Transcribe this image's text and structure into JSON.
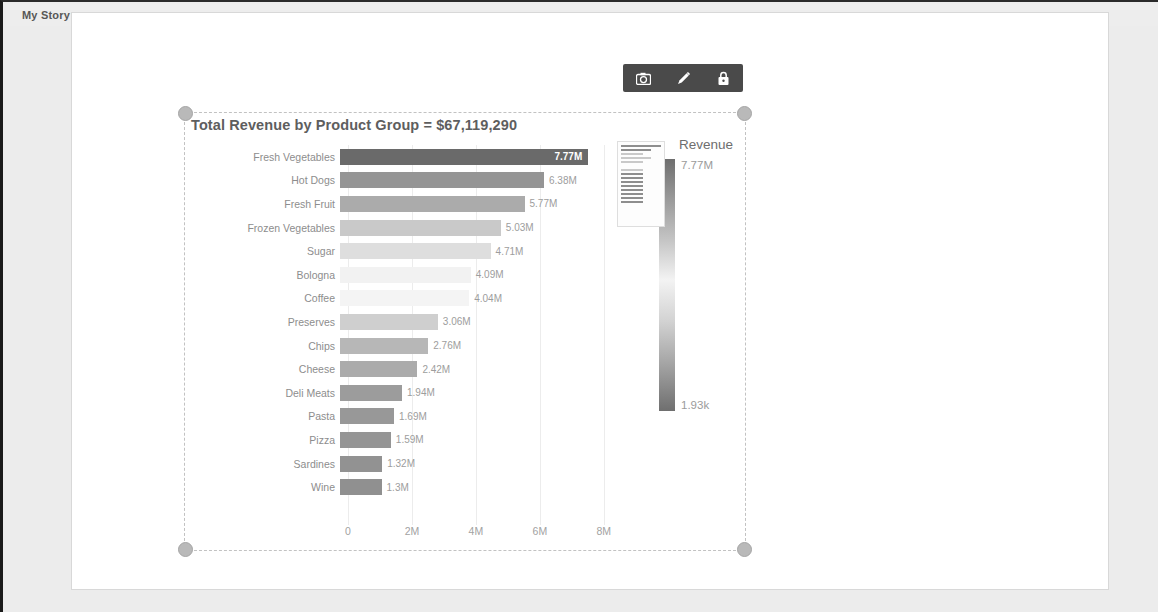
{
  "story": {
    "tab_label": "My Story"
  },
  "toolbar": {
    "camera_label": "camera-icon",
    "edit_label": "pencil-icon",
    "lock_label": "lock-icon"
  },
  "chart_data": {
    "type": "bar",
    "orientation": "horizontal",
    "title": "Total Revenue by Product Group = $67,119,290",
    "xlabel": "",
    "ylabel": "",
    "xlim": [
      0,
      8600000
    ],
    "grid": true,
    "legend": {
      "title": "Revenue",
      "position": "right",
      "max_label": "7.77M",
      "min_label": "1.93k"
    },
    "xticks": [
      "0",
      "2M",
      "4M",
      "6M",
      "8M"
    ],
    "xtick_values": [
      0,
      2000000,
      4000000,
      6000000,
      8000000
    ],
    "categories": [
      "Fresh Vegetables",
      "Hot Dogs",
      "Fresh Fruit",
      "Frozen Vegetables",
      "Sugar",
      "Bologna",
      "Coffee",
      "Preserves",
      "Chips",
      "Cheese",
      "Deli Meats",
      "Pasta",
      "Pizza",
      "Sardines",
      "Wine"
    ],
    "values": [
      7770000,
      6380000,
      5770000,
      5030000,
      4710000,
      4090000,
      4040000,
      3060000,
      2760000,
      2420000,
      1940000,
      1690000,
      1590000,
      1320000,
      1300000
    ],
    "value_labels": [
      "7.77M",
      "6.38M",
      "5.77M",
      "5.03M",
      "4.71M",
      "4.09M",
      "4.04M",
      "3.06M",
      "2.76M",
      "2.42M",
      "1.94M",
      "1.69M",
      "1.59M",
      "1.32M",
      "1.3M"
    ],
    "bar_colors": [
      "#6a6a6a",
      "#959595",
      "#ababab",
      "#c9c9c9",
      "#dedede",
      "#f2f2f2",
      "#f4f4f4",
      "#cfcfcf",
      "#b7b7b7",
      "#ababab",
      "#9c9c9c",
      "#989898",
      "#959595",
      "#929292",
      "#909090"
    ]
  }
}
